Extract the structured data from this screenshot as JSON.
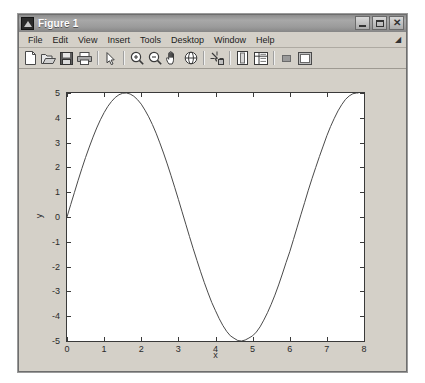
{
  "window": {
    "title": "Figure 1",
    "icon": "matlab-figure-icon",
    "controls": [
      {
        "name": "minimize-button",
        "label": "Minimize",
        "glyph": "minimize"
      },
      {
        "name": "maximize-button",
        "label": "Maximize",
        "glyph": "maximize"
      },
      {
        "name": "close-button",
        "label": "Close",
        "glyph": "close"
      }
    ]
  },
  "menubar": {
    "items": [
      {
        "label": "File"
      },
      {
        "label": "Edit"
      },
      {
        "label": "View"
      },
      {
        "label": "Insert"
      },
      {
        "label": "Tools"
      },
      {
        "label": "Desktop"
      },
      {
        "label": "Window"
      },
      {
        "label": "Help"
      }
    ],
    "overflow_glyph": "◢"
  },
  "toolbar": {
    "items": [
      {
        "name": "new-figure-icon",
        "label": "New Figure"
      },
      {
        "name": "open-file-icon",
        "label": "Open File"
      },
      {
        "name": "save-figure-icon",
        "label": "Save Figure"
      },
      {
        "name": "print-figure-icon",
        "label": "Print Figure"
      },
      {
        "name": "separator-1",
        "label": ""
      },
      {
        "name": "edit-plot-pointer-icon",
        "label": "Edit Plot"
      },
      {
        "name": "separator-2",
        "label": ""
      },
      {
        "name": "zoom-in-icon",
        "label": "Zoom In"
      },
      {
        "name": "zoom-out-icon",
        "label": "Zoom Out"
      },
      {
        "name": "pan-hand-icon",
        "label": "Pan"
      },
      {
        "name": "rotate-3d-icon",
        "label": "Rotate 3D"
      },
      {
        "name": "separator-3",
        "label": ""
      },
      {
        "name": "data-cursor-icon",
        "label": "Data Cursor"
      },
      {
        "name": "separator-4",
        "label": ""
      },
      {
        "name": "insert-colorbar-icon",
        "label": "Insert Colorbar"
      },
      {
        "name": "insert-legend-icon",
        "label": "Insert Legend"
      },
      {
        "name": "separator-5",
        "label": ""
      },
      {
        "name": "hide-plot-tools-icon",
        "label": "Hide Plot Tools"
      },
      {
        "name": "show-plot-tools-icon",
        "label": "Show Plot Tools"
      }
    ]
  },
  "chart_data": {
    "type": "line",
    "title": "",
    "xlabel": "x",
    "ylabel": "y",
    "xlim": [
      0,
      8
    ],
    "ylim": [
      -5,
      5
    ],
    "xticks": [
      0,
      1,
      2,
      3,
      4,
      5,
      6,
      7,
      8
    ],
    "yticks": [
      5,
      4,
      3,
      2,
      1,
      0,
      -1,
      -2,
      -3,
      -4,
      -5
    ],
    "xticklabels": [
      "0",
      "1",
      "2",
      "3",
      "4",
      "5",
      "6",
      "7",
      "8"
    ],
    "yticklabels": [
      "5",
      "4",
      "3",
      "2",
      "1",
      "0",
      "-1",
      "-2",
      "-3",
      "-4",
      "-5"
    ],
    "grid": false,
    "legend": null,
    "line_color": "#4a4a4a",
    "line_width": 1,
    "background": "#ffffff",
    "series": [
      {
        "name": "5*sin(x)",
        "expression": "y = 5*sin(x)",
        "x": [
          0.0,
          0.1,
          0.2,
          0.3,
          0.4,
          0.5,
          0.6,
          0.7,
          0.8,
          0.9,
          1.0,
          1.1,
          1.2,
          1.3,
          1.4,
          1.5,
          1.6,
          1.7,
          1.8,
          1.9,
          2.0,
          2.1,
          2.2,
          2.3,
          2.4,
          2.5,
          2.6,
          2.7,
          2.8,
          2.9,
          3.0,
          3.1,
          3.2,
          3.3,
          3.4,
          3.5,
          3.6,
          3.7,
          3.8,
          3.9,
          4.0,
          4.1,
          4.2,
          4.3,
          4.4,
          4.5,
          4.6,
          4.7,
          4.8,
          4.9,
          5.0,
          5.1,
          5.2,
          5.3,
          5.4,
          5.5,
          5.6,
          5.7,
          5.8,
          5.9,
          6.0,
          6.1,
          6.2,
          6.3,
          6.4,
          6.5,
          6.6,
          6.7,
          6.8,
          6.9,
          7.0,
          7.1,
          7.2,
          7.3,
          7.4,
          7.5,
          7.6,
          7.7,
          7.8,
          7.85
        ],
        "y": [
          0.0,
          0.5,
          0.99,
          1.48,
          1.95,
          2.4,
          2.82,
          3.22,
          3.59,
          3.92,
          4.21,
          4.46,
          4.66,
          4.82,
          4.93,
          4.99,
          5.0,
          4.96,
          4.87,
          4.73,
          4.55,
          4.31,
          4.04,
          3.73,
          3.38,
          2.99,
          2.58,
          2.14,
          1.68,
          1.2,
          0.71,
          0.21,
          -0.29,
          -0.79,
          -1.28,
          -1.75,
          -2.21,
          -2.65,
          -3.06,
          -3.45,
          -3.78,
          -4.1,
          -4.38,
          -4.61,
          -4.79,
          -4.89,
          -4.98,
          -5.0,
          -4.96,
          -4.88,
          -4.79,
          -4.64,
          -4.43,
          -4.16,
          -3.86,
          -3.52,
          -3.15,
          -2.74,
          -2.3,
          -1.84,
          -1.4,
          -0.91,
          -0.41,
          0.09,
          0.58,
          1.08,
          1.55,
          2.0,
          2.44,
          2.86,
          3.28,
          3.65,
          3.98,
          4.28,
          4.53,
          4.74,
          4.88,
          4.97,
          5.0,
          5.0
        ]
      }
    ]
  }
}
